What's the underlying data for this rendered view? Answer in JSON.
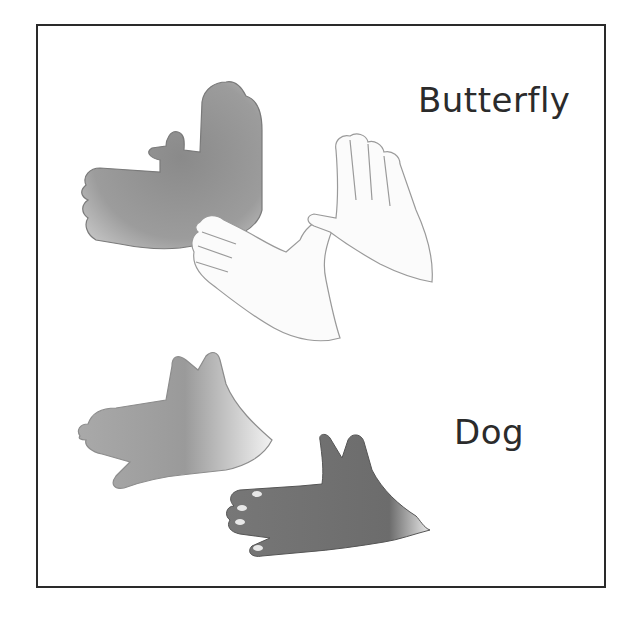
{
  "illustration": {
    "kind": "hand-shadow-puppets",
    "figures": [
      {
        "id": "butterfly",
        "label": "Butterfly",
        "shadow_color": "#8f8f8f",
        "hands_color": "#fafafa"
      },
      {
        "id": "dog",
        "label": "Dog",
        "shadow_color": "#9a9a9a",
        "hands_color": "#6e6e6e"
      }
    ]
  },
  "colors": {
    "frame": "#2a2a2a",
    "text": "#2b2b2b",
    "background": "#ffffff"
  }
}
